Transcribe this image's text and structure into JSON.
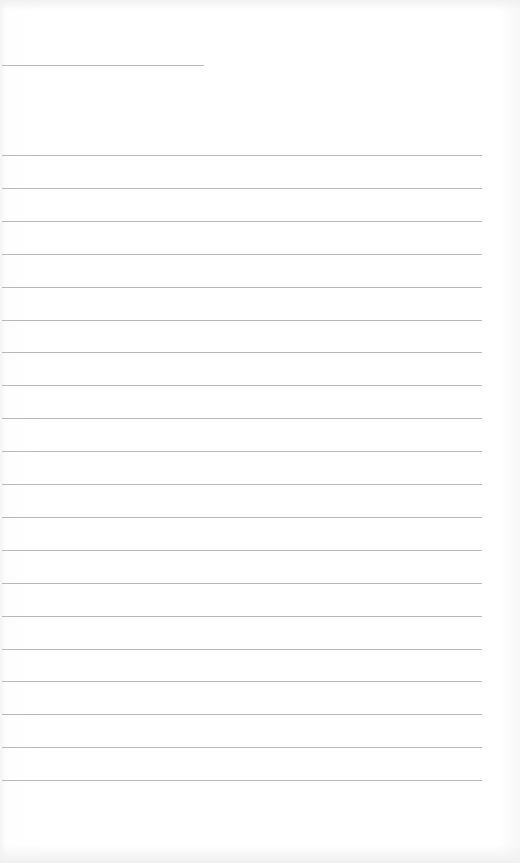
{
  "document": {
    "type": "lined-paper",
    "background_color": "#ffffff",
    "line_color": "#b9b9b9",
    "header_rule": {
      "top": 65,
      "left": 2,
      "width": 202
    },
    "ruled_lines": {
      "count": 20,
      "first_top": 155,
      "spacing": 32.9,
      "left": 2,
      "width": 480
    }
  }
}
